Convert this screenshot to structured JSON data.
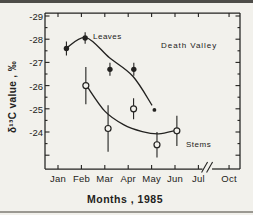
{
  "figure": {
    "background": "#f2f1ec",
    "ink": "#232220",
    "top_rule_color": "#4e4d49",
    "bottom_rule_color": "#9b9992"
  },
  "chart_data": {
    "type": "scatter",
    "title": "",
    "annotation": "Death Valley",
    "xlabel": "Months , 1985",
    "ylabel": "δ¹³C value , ‰",
    "y_ticks": [
      -29,
      -28,
      -27,
      -26,
      -25,
      -24
    ],
    "y_axis_note": "inverted axis, -29 at top; minor ticks every 0.5",
    "x_ticks": [
      {
        "label": "Jan",
        "m": 0
      },
      {
        "label": "Feb",
        "m": 1
      },
      {
        "label": "Mar",
        "m": 2
      },
      {
        "label": "Apr",
        "m": 3
      },
      {
        "label": "May",
        "m": 4
      },
      {
        "label": "Jun",
        "m": 5
      },
      {
        "label": "Jul",
        "m": 6
      },
      {
        "label": "Oct",
        "m": 7.31
      }
    ],
    "x_break_m": 6.37,
    "x_axis_break": "axis break (//) between Jul and Oct",
    "series": [
      {
        "name": "Leaves",
        "marker": "filled-circle",
        "points": [
          {
            "month": "Jan",
            "m": 0.36,
            "value": -27.6,
            "err": 0.3
          },
          {
            "month": "Feb",
            "m": 1.16,
            "value": -28.05,
            "err": 0.25
          },
          {
            "month": "Mar",
            "m": 2.22,
            "value": -26.7,
            "err": 0.28
          },
          {
            "month": "Apr",
            "m": 3.24,
            "value": -26.7,
            "err": 0.28
          },
          {
            "month": "May",
            "m": 4.12,
            "value": -24.95,
            "err": 0,
            "small": true
          }
        ],
        "trend": [
          [
            0.36,
            -27.62
          ],
          [
            1.2,
            -28.07
          ],
          [
            2.2,
            -27.2
          ],
          [
            3.2,
            -26.4
          ],
          [
            4.02,
            -25.15
          ]
        ]
      },
      {
        "name": "Stems",
        "marker": "open-circle",
        "points": [
          {
            "month": "Feb",
            "m": 1.19,
            "value": -26.0,
            "err": 0.8
          },
          {
            "month": "Mar",
            "m": 2.14,
            "value": -24.15,
            "err": 1.0
          },
          {
            "month": "Apr",
            "m": 3.23,
            "value": -25.0,
            "err": 0.45
          },
          {
            "month": "May",
            "m": 4.23,
            "value": -23.45,
            "err": 0.55
          },
          {
            "month": "Jun",
            "m": 5.08,
            "value": -24.05,
            "err": 0.65
          }
        ],
        "trend": [
          [
            1.22,
            -26.0
          ],
          [
            2.0,
            -24.9
          ],
          [
            2.8,
            -24.32
          ],
          [
            3.6,
            -24.02
          ],
          [
            4.3,
            -23.92
          ],
          [
            5.05,
            -24.07
          ]
        ]
      }
    ]
  }
}
